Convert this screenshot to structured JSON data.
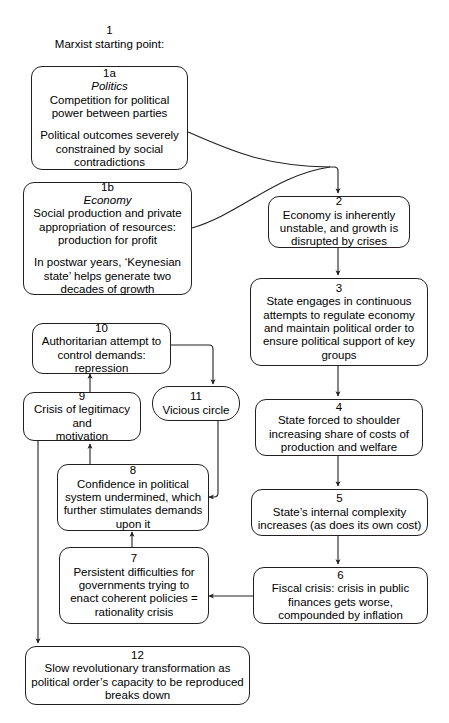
{
  "diagram": {
    "title_num": "1",
    "title_text": "Marxist starting point:",
    "nodes": {
      "n1a": {
        "num": "1a",
        "subtitle": "Politics",
        "text": "Competition for political\npower between parties",
        "text2": "Political outcomes severely\nconstrained by social\ncontradictions"
      },
      "n1b": {
        "num": "1b",
        "subtitle": "Economy",
        "text": "Social production and private\nappropriation of resources:\nproduction for profit",
        "text2": "In postwar years, ‘Keynesian\nstate’ helps generate two\ndecades of growth"
      },
      "n2": {
        "num": "2",
        "text": "Economy is inherently\nunstable, and growth is\ndisrupted by crises"
      },
      "n3": {
        "num": "3",
        "text": "State engages in continuous\nattempts to regulate economy\nand maintain political order to\nensure political support of key\ngroups"
      },
      "n4": {
        "num": "4",
        "text": "State forced to shoulder\nincreasing share of costs of\nproduction and welfare"
      },
      "n5": {
        "num": "5",
        "text": "State’s internal complexity\nincreases (as does its own cost)"
      },
      "n6": {
        "num": "6",
        "text": "Fiscal crisis: crisis in public\nfinances gets worse,\ncompounded by inflation"
      },
      "n7": {
        "num": "7",
        "text": "Persistent difficulties for\ngovernments trying to\nenact coherent policies =\nrationality crisis"
      },
      "n8": {
        "num": "8",
        "text": "Confidence in political\nsystem undermined, which\nfurther stimulates demands\nupon it"
      },
      "n9": {
        "num": "9",
        "text": "Crisis of legitimacy and\nmotivation"
      },
      "n10": {
        "num": "10",
        "text": "Authoritarian attempt to\ncontrol demands:\nrepression"
      },
      "n11": {
        "num": "11",
        "text": "Vicious circle"
      },
      "n12": {
        "num": "12",
        "text": "Slow revolutionary transformation as\npolitical order’s capacity to be reproduced\nbreaks down"
      }
    },
    "edges": [
      {
        "id": "e-1a-2",
        "from": "1a",
        "to": "2",
        "style": "curve"
      },
      {
        "id": "e-1b-2",
        "from": "1b",
        "to": "2",
        "style": "curve"
      },
      {
        "id": "e-2-3",
        "from": "2",
        "to": "3",
        "style": "straight"
      },
      {
        "id": "e-3-4",
        "from": "3",
        "to": "4",
        "style": "straight"
      },
      {
        "id": "e-4-5",
        "from": "4",
        "to": "5",
        "style": "straight"
      },
      {
        "id": "e-5-6",
        "from": "5",
        "to": "6",
        "style": "straight"
      },
      {
        "id": "e-6-7",
        "from": "6",
        "to": "7",
        "style": "straight"
      },
      {
        "id": "e-7-8",
        "from": "7",
        "to": "8",
        "style": "straight"
      },
      {
        "id": "e-8-9",
        "from": "8",
        "to": "9",
        "style": "straight"
      },
      {
        "id": "e-9-10",
        "from": "9",
        "to": "10",
        "style": "straight"
      },
      {
        "id": "e-10-11",
        "from": "10",
        "to": "11",
        "style": "elbow"
      },
      {
        "id": "e-11-8",
        "from": "11",
        "to": "8",
        "style": "elbow"
      },
      {
        "id": "e-9-12",
        "from": "9",
        "to": "12",
        "style": "elbow"
      }
    ],
    "colors": {
      "stroke": "#231f20",
      "background": "#ffffff",
      "text": "#000000"
    }
  }
}
